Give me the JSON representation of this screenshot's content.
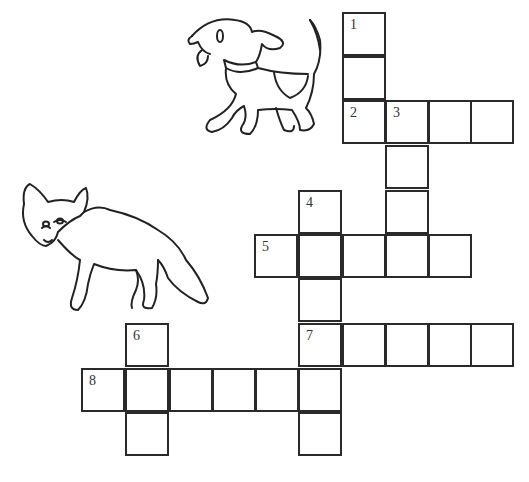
{
  "puzzle": {
    "type": "crossword",
    "cell_size": 44,
    "cells": [
      {
        "x": 342,
        "y": 12,
        "num": "1"
      },
      {
        "x": 342,
        "y": 56,
        "num": ""
      },
      {
        "x": 342,
        "y": 100,
        "num": "2"
      },
      {
        "x": 385,
        "y": 100,
        "num": "3"
      },
      {
        "x": 428,
        "y": 100,
        "num": ""
      },
      {
        "x": 470,
        "y": 100,
        "num": ""
      },
      {
        "x": 385,
        "y": 145,
        "num": ""
      },
      {
        "x": 385,
        "y": 190,
        "num": ""
      },
      {
        "x": 298,
        "y": 190,
        "num": "4"
      },
      {
        "x": 254,
        "y": 234,
        "num": "5"
      },
      {
        "x": 298,
        "y": 234,
        "num": ""
      },
      {
        "x": 342,
        "y": 234,
        "num": ""
      },
      {
        "x": 385,
        "y": 234,
        "num": ""
      },
      {
        "x": 428,
        "y": 234,
        "num": ""
      },
      {
        "x": 298,
        "y": 278,
        "num": ""
      },
      {
        "x": 298,
        "y": 323,
        "num": "7"
      },
      {
        "x": 342,
        "y": 323,
        "num": ""
      },
      {
        "x": 385,
        "y": 323,
        "num": ""
      },
      {
        "x": 428,
        "y": 323,
        "num": ""
      },
      {
        "x": 470,
        "y": 323,
        "num": ""
      },
      {
        "x": 125,
        "y": 323,
        "num": "6"
      },
      {
        "x": 81,
        "y": 368,
        "num": "8"
      },
      {
        "x": 125,
        "y": 368,
        "num": ""
      },
      {
        "x": 169,
        "y": 368,
        "num": ""
      },
      {
        "x": 212,
        "y": 368,
        "num": ""
      },
      {
        "x": 255,
        "y": 368,
        "num": ""
      },
      {
        "x": 298,
        "y": 368,
        "num": ""
      },
      {
        "x": 125,
        "y": 412,
        "num": ""
      },
      {
        "x": 298,
        "y": 412,
        "num": ""
      }
    ],
    "clue_numbers": [
      "1",
      "2",
      "3",
      "4",
      "5",
      "6",
      "7",
      "8"
    ]
  },
  "illustrations": [
    {
      "name": "dog",
      "icon": "dog-icon"
    },
    {
      "name": "fox",
      "icon": "fox-icon"
    }
  ],
  "colors": {
    "line": "#2a2a2a",
    "background": "#ffffff"
  }
}
